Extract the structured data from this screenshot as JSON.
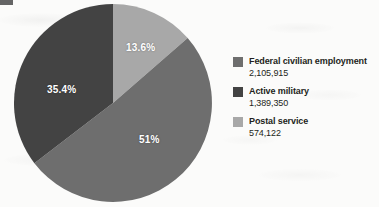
{
  "chart_data": {
    "type": "pie",
    "title": "",
    "labels": [
      "Federal civilian employment",
      "Active military",
      "Postal service"
    ],
    "values": [
      2105915,
      1389350,
      574122
    ],
    "value_labels": [
      "2,105,915",
      "1,389,350",
      "574,122"
    ],
    "percent_labels": [
      "51%",
      "35.4%",
      "13.6%"
    ],
    "percents": [
      51.0,
      35.4,
      13.6
    ],
    "colors": [
      "#6e6e6e",
      "#434343",
      "#a8a8a8"
    ],
    "legend_position": "right",
    "grid": false,
    "xlabel": "",
    "ylabel": "",
    "slice_order_clockwise_from_top": [
      "Postal service",
      "Federal civilian employment",
      "Active military"
    ]
  },
  "pie": {
    "slices": [
      {
        "name": "postal-service",
        "percent_label": "13.6%",
        "color": "#a8a8a8",
        "start_deg": 0,
        "sweep_deg": 48.96
      },
      {
        "name": "federal-civilian-employment",
        "percent_label": "51%",
        "color": "#6e6e6e",
        "start_deg": 48.96,
        "sweep_deg": 183.6
      },
      {
        "name": "active-military",
        "percent_label": "35.4%",
        "color": "#434343",
        "start_deg": 232.56,
        "sweep_deg": 127.44
      }
    ]
  },
  "legend": {
    "items": [
      {
        "label": "Federal civilian employment",
        "value": "2,105,915",
        "color": "#6e6e6e"
      },
      {
        "label": "Active military",
        "value": "1,389,350",
        "color": "#434343"
      },
      {
        "label": "Postal service",
        "value": "574,122",
        "color": "#a8a8a8"
      }
    ]
  }
}
